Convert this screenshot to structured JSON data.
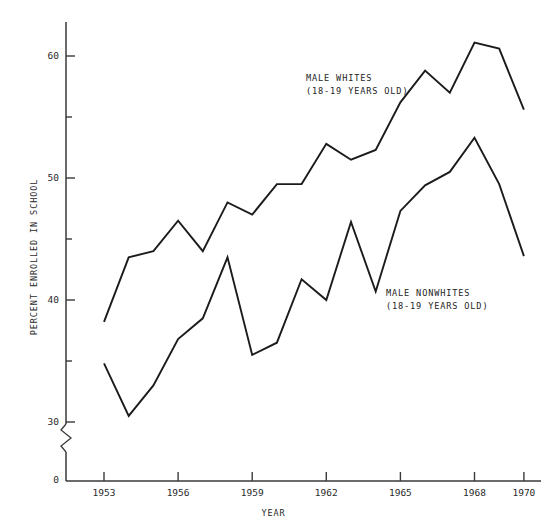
{
  "chart_data": {
    "type": "line",
    "title": "",
    "xlabel": "YEAR",
    "ylabel": "PERCENT ENROLLED IN SCHOOL",
    "x": [
      1953,
      1954,
      1955,
      1956,
      1957,
      1958,
      1959,
      1960,
      1961,
      1962,
      1963,
      1964,
      1965,
      1966,
      1967,
      1968,
      1969,
      1970
    ],
    "xlim": [
      1952,
      1970.6
    ],
    "ylim": [
      30,
      63
    ],
    "y_axis_break": true,
    "y_axis_break_note": "axis broken between 0 and 30",
    "grid": false,
    "legend_position": "inline-annotation",
    "xticks": [
      1953,
      1956,
      1959,
      1962,
      1965,
      1968,
      1970
    ],
    "xtick_labels": [
      "1953",
      "1956",
      "1959",
      "1962",
      "1965",
      "1968",
      "1970"
    ],
    "yticks": [
      0,
      30,
      40,
      50,
      60
    ],
    "ytick_labels": [
      "0",
      "30",
      "40",
      "50",
      "60"
    ],
    "yminorticks": [
      35,
      45,
      55
    ],
    "series": [
      {
        "name": "MALE WHITES",
        "sublabel": "(18-19 YEARS OLD)",
        "color": "#1b1b1b",
        "values": [
          38.2,
          43.5,
          44.0,
          46.5,
          44.0,
          48.0,
          47.0,
          49.5,
          49.5,
          52.8,
          51.5,
          52.3,
          56.2,
          58.8,
          57.0,
          61.1,
          60.6,
          55.6
        ]
      },
      {
        "name": "MALE NONWHITES",
        "sublabel": "(18-19 YEARS OLD)",
        "color": "#1b1b1b",
        "values": [
          34.8,
          30.5,
          33.0,
          36.8,
          38.5,
          43.5,
          35.5,
          36.5,
          41.7,
          40.0,
          46.4,
          40.7,
          47.3,
          49.4,
          50.5,
          53.3,
          49.5,
          43.6
        ]
      }
    ],
    "annotations": [
      {
        "name": "MALE WHITES",
        "sublabel": "(18-19 YEARS OLD)",
        "x_px": 306,
        "y_px": 72
      },
      {
        "name": "MALE NONWHITES",
        "sublabel": "(18-19 YEARS OLD)",
        "x_px": 386,
        "y_px": 287
      }
    ]
  },
  "axes": {
    "ylabel": "PERCENT ENROLLED IN SCHOOL",
    "xlabel": "YEAR",
    "ytick_labels": [
      "60",
      "50",
      "40",
      "30",
      "0"
    ],
    "xtick_labels": [
      "1953",
      "1956",
      "1959",
      "1962",
      "1965",
      "1968",
      "1970"
    ]
  },
  "annotations": {
    "whites_title": "MALE WHITES",
    "whites_sub": "(18-19 YEARS OLD)",
    "nonwhites_title": "MALE NONWHITES",
    "nonwhites_sub": "(18-19 YEARS OLD)"
  }
}
